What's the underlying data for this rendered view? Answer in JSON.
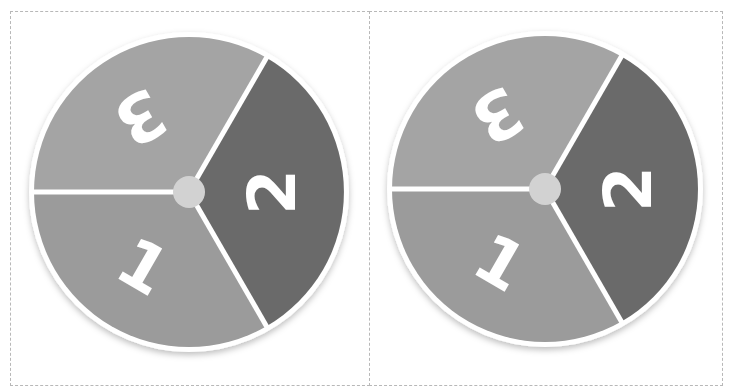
{
  "colors": {
    "segment_1": "#9b9b9b",
    "segment_2": "#6a6a6a",
    "segment_3": "#a4a4a4",
    "divider": "#ffffff",
    "hub": "#d2d2d2",
    "rim": "#ffffff",
    "border": "#b8b8b8"
  },
  "spinners": [
    {
      "name": "spinner-left",
      "segments": [
        {
          "label": "3",
          "position": "upper-left"
        },
        {
          "label": "2",
          "position": "right"
        },
        {
          "label": "1",
          "position": "lower-left"
        }
      ]
    },
    {
      "name": "spinner-right",
      "segments": [
        {
          "label": "3",
          "position": "upper-left"
        },
        {
          "label": "2",
          "position": "right"
        },
        {
          "label": "1",
          "position": "lower-left"
        }
      ]
    }
  ]
}
